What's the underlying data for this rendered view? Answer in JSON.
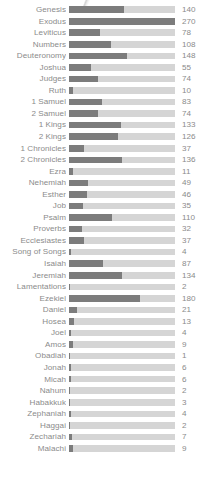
{
  "chart_data": {
    "type": "bar",
    "orientation": "horizontal",
    "title": "",
    "subtitle": "",
    "xlabel": "",
    "ylabel": "",
    "grid": false,
    "legend": null,
    "axis_ticks_visible": false,
    "value_labels_visible": true,
    "xlim": [
      0,
      270
    ],
    "categories": [
      "Genesis",
      "Exodus",
      "Leviticus",
      "Numbers",
      "Deuteronomy",
      "Joshua",
      "Judges",
      "Ruth",
      "1 Samuel",
      "2 Samuel",
      "1 Kings",
      "2 Kings",
      "1 Chronicles",
      "2 Chronicles",
      "Ezra",
      "Nehemiah",
      "Esther",
      "Job",
      "Psalm",
      "Proverbs",
      "Ecclesiastes",
      "Song of Songs",
      "Isaiah",
      "Jeremiah",
      "Lamentations",
      "Ezekiel",
      "Daniel",
      "Hosea",
      "Joel",
      "Amos",
      "Obadiah",
      "Jonah",
      "Micah",
      "Nahum",
      "Habakkuk",
      "Zephaniah",
      "Haggai",
      "Zechariah",
      "Malachi"
    ],
    "values": [
      140,
      270,
      78,
      108,
      148,
      55,
      74,
      10,
      83,
      74,
      133,
      126,
      37,
      136,
      11,
      49,
      46,
      35,
      110,
      32,
      37,
      4,
      87,
      134,
      2,
      180,
      21,
      13,
      4,
      9,
      1,
      6,
      6,
      2,
      3,
      4,
      2,
      7,
      9
    ],
    "rows": [
      {
        "label": "Genesis",
        "value": 140
      },
      {
        "label": "Exodus",
        "value": 270
      },
      {
        "label": "Leviticus",
        "value": 78
      },
      {
        "label": "Numbers",
        "value": 108
      },
      {
        "label": "Deuteronomy",
        "value": 148
      },
      {
        "label": "Joshua",
        "value": 55
      },
      {
        "label": "Judges",
        "value": 74
      },
      {
        "label": "Ruth",
        "value": 10
      },
      {
        "label": "1 Samuel",
        "value": 83
      },
      {
        "label": "2 Samuel",
        "value": 74
      },
      {
        "label": "1 Kings",
        "value": 133
      },
      {
        "label": "2 Kings",
        "value": 126
      },
      {
        "label": "1 Chronicles",
        "value": 37
      },
      {
        "label": "2 Chronicles",
        "value": 136
      },
      {
        "label": "Ezra",
        "value": 11
      },
      {
        "label": "Nehemiah",
        "value": 49
      },
      {
        "label": "Esther",
        "value": 46
      },
      {
        "label": "Job",
        "value": 35
      },
      {
        "label": "Psalm",
        "value": 110
      },
      {
        "label": "Proverbs",
        "value": 32
      },
      {
        "label": "Ecclesiastes",
        "value": 37
      },
      {
        "label": "Song of Songs",
        "value": 4
      },
      {
        "label": "Isaiah",
        "value": 87
      },
      {
        "label": "Jeremiah",
        "value": 134
      },
      {
        "label": "Lamentations",
        "value": 2
      },
      {
        "label": "Ezekiel",
        "value": 180
      },
      {
        "label": "Daniel",
        "value": 21
      },
      {
        "label": "Hosea",
        "value": 13
      },
      {
        "label": "Joel",
        "value": 4
      },
      {
        "label": "Amos",
        "value": 9
      },
      {
        "label": "Obadiah",
        "value": 1
      },
      {
        "label": "Jonah",
        "value": 6
      },
      {
        "label": "Micah",
        "value": 6
      },
      {
        "label": "Nahum",
        "value": 2
      },
      {
        "label": "Habakkuk",
        "value": 3
      },
      {
        "label": "Zephaniah",
        "value": 4
      },
      {
        "label": "Haggai",
        "value": 2
      },
      {
        "label": "Zechariah",
        "value": 7
      },
      {
        "label": "Malachi",
        "value": 9
      }
    ],
    "colors": {
      "bar_fill": "#7c7c7c",
      "bar_track": "#d5d5d5",
      "label_text": "#8b8b8b",
      "value_text": "#8b8b8b",
      "background": "#ffffff"
    }
  }
}
